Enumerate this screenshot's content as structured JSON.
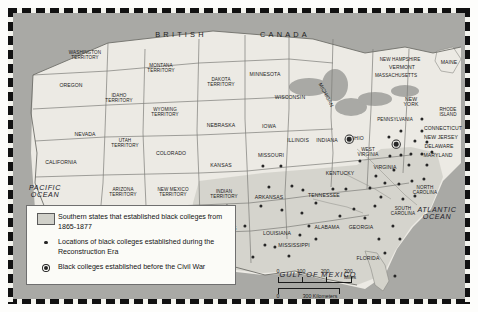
{
  "map": {
    "country_labels": [
      {
        "name": "british",
        "text": "BRITISH",
        "x": 168,
        "y": 22
      },
      {
        "name": "canada",
        "text": "CANADA",
        "x": 272,
        "y": 22
      }
    ],
    "ocean_labels": [
      {
        "name": "pacific-ocean",
        "text": "PACIFIC\nOCEAN",
        "x": 32,
        "y": 178
      },
      {
        "name": "atlantic-ocean",
        "text": "ATLANTIC\nOCEAN",
        "x": 424,
        "y": 200
      },
      {
        "name": "gulf-of-mexico",
        "text": "GULF OF MEXICO",
        "x": 305,
        "y": 262
      }
    ],
    "state_labels": [
      {
        "name": "washington-territory",
        "text": "WASHINGTON\nTERRITORY",
        "x": 72,
        "y": 43
      },
      {
        "name": "oregon",
        "text": "OREGON",
        "x": 58,
        "y": 73
      },
      {
        "name": "idaho-territory",
        "text": "IDAHO\nTERRITORY",
        "x": 106,
        "y": 86
      },
      {
        "name": "montana-territory",
        "text": "MONTANA\nTERRITORY",
        "x": 148,
        "y": 56
      },
      {
        "name": "wyoming-territory",
        "text": "WYOMING\nTERRITORY",
        "x": 152,
        "y": 100
      },
      {
        "name": "dakota-territory",
        "text": "DAKOTA\nTERRITORY",
        "x": 208,
        "y": 70
      },
      {
        "name": "minnesota",
        "text": "MINNESOTA",
        "x": 252,
        "y": 62
      },
      {
        "name": "wisconsin",
        "text": "WISCONSIN",
        "x": 277,
        "y": 85
      },
      {
        "name": "michigan",
        "text": "MICHIGAN",
        "x": 313,
        "y": 82,
        "rotate": 62
      },
      {
        "name": "nebraska",
        "text": "NEBRASKA",
        "x": 208,
        "y": 113
      },
      {
        "name": "iowa",
        "text": "IOWA",
        "x": 256,
        "y": 114
      },
      {
        "name": "illinois",
        "text": "ILLINOIS",
        "x": 285,
        "y": 128
      },
      {
        "name": "indiana",
        "text": "INDIANA",
        "x": 314,
        "y": 128
      },
      {
        "name": "ohio",
        "text": "OHIO",
        "x": 344,
        "y": 126
      },
      {
        "name": "nevada",
        "text": "NEVADA",
        "x": 72,
        "y": 122
      },
      {
        "name": "utah-territory",
        "text": "UTAH\nTERRITORY",
        "x": 112,
        "y": 131
      },
      {
        "name": "colorado",
        "text": "COLORADO",
        "x": 158,
        "y": 141
      },
      {
        "name": "california",
        "text": "CALIFORNIA",
        "x": 48,
        "y": 150
      },
      {
        "name": "kansas",
        "text": "KANSAS",
        "x": 208,
        "y": 153
      },
      {
        "name": "missouri",
        "text": "MISSOURI",
        "x": 258,
        "y": 143
      },
      {
        "name": "kentucky",
        "text": "KENTUCKY",
        "x": 327,
        "y": 161
      },
      {
        "name": "arizona-territory",
        "text": "ARIZONA\nTERRITORY",
        "x": 110,
        "y": 180
      },
      {
        "name": "new-mexico-territory",
        "text": "NEW MEXICO\nTERRITORY",
        "x": 160,
        "y": 180
      },
      {
        "name": "indian-territory",
        "text": "INDIAN\nTERRITORY",
        "x": 211,
        "y": 182
      },
      {
        "name": "arkansas",
        "text": "ARKANSAS",
        "x": 256,
        "y": 185
      },
      {
        "name": "tennessee",
        "text": "TENNESSEE",
        "x": 311,
        "y": 183
      },
      {
        "name": "texas",
        "text": "TEXAS",
        "x": 215,
        "y": 216
      },
      {
        "name": "louisiana",
        "text": "LOUISIANA",
        "x": 264,
        "y": 221
      },
      {
        "name": "mississippi",
        "text": "MISSISSIPPI",
        "x": 281,
        "y": 233
      },
      {
        "name": "alabama",
        "text": "ALABAMA",
        "x": 314,
        "y": 215
      },
      {
        "name": "georgia",
        "text": "GEORGIA",
        "x": 348,
        "y": 215
      },
      {
        "name": "florida",
        "text": "FLORIDA",
        "x": 355,
        "y": 246
      },
      {
        "name": "south-carolina",
        "text": "SOUTH\nCAROLINA",
        "x": 390,
        "y": 199
      },
      {
        "name": "north-carolina",
        "text": "NORTH\nCAROLINA",
        "x": 412,
        "y": 178
      },
      {
        "name": "virginia",
        "text": "VIRGINIA",
        "x": 372,
        "y": 155
      },
      {
        "name": "west-virginia",
        "text": "WEST\nVIRGINIA",
        "x": 355,
        "y": 140
      },
      {
        "name": "pennsylvania",
        "text": "PENNSYLVANIA",
        "x": 382,
        "y": 107
      },
      {
        "name": "new-york",
        "text": "NEW\nYORK",
        "x": 398,
        "y": 89
      },
      {
        "name": "new-hampshire",
        "text": "NEW HAMPSHIRE",
        "x": 387,
        "y": 47
      },
      {
        "name": "vermont",
        "text": "VERMONT",
        "x": 389,
        "y": 55
      },
      {
        "name": "massachusetts",
        "text": "MASSACHUSETTS",
        "x": 383,
        "y": 63
      },
      {
        "name": "maine",
        "text": "MAINE",
        "x": 436,
        "y": 50
      },
      {
        "name": "rhode-island",
        "text": "RHODE\nISLAND",
        "x": 435,
        "y": 100
      },
      {
        "name": "connecticut",
        "text": "CONNECTICUT",
        "x": 430,
        "y": 116
      },
      {
        "name": "new-jersey",
        "text": "NEW JERSEY",
        "x": 428,
        "y": 125
      },
      {
        "name": "delaware",
        "text": "DELAWARE",
        "x": 426,
        "y": 134
      },
      {
        "name": "maryland",
        "text": "MARYLAND",
        "x": 425,
        "y": 143
      }
    ],
    "reconstruction_colleges": [
      {
        "x": 250,
        "y": 153
      },
      {
        "x": 268,
        "y": 153
      },
      {
        "x": 256,
        "y": 174
      },
      {
        "x": 279,
        "y": 173
      },
      {
        "x": 248,
        "y": 193
      },
      {
        "x": 269,
        "y": 197
      },
      {
        "x": 290,
        "y": 177
      },
      {
        "x": 303,
        "y": 190
      },
      {
        "x": 320,
        "y": 176
      },
      {
        "x": 333,
        "y": 176
      },
      {
        "x": 289,
        "y": 200
      },
      {
        "x": 296,
        "y": 213
      },
      {
        "x": 303,
        "y": 226
      },
      {
        "x": 287,
        "y": 222
      },
      {
        "x": 276,
        "y": 243
      },
      {
        "x": 262,
        "y": 234
      },
      {
        "x": 252,
        "y": 232
      },
      {
        "x": 232,
        "y": 213
      },
      {
        "x": 221,
        "y": 231
      },
      {
        "x": 205,
        "y": 243
      },
      {
        "x": 240,
        "y": 244
      },
      {
        "x": 214,
        "y": 193
      },
      {
        "x": 198,
        "y": 205
      },
      {
        "x": 185,
        "y": 232
      },
      {
        "x": 327,
        "y": 203
      },
      {
        "x": 341,
        "y": 196
      },
      {
        "x": 352,
        "y": 205
      },
      {
        "x": 362,
        "y": 193
      },
      {
        "x": 366,
        "y": 226
      },
      {
        "x": 380,
        "y": 213
      },
      {
        "x": 387,
        "y": 226
      },
      {
        "x": 372,
        "y": 240
      },
      {
        "x": 382,
        "y": 263
      },
      {
        "x": 347,
        "y": 148
      },
      {
        "x": 363,
        "y": 163
      },
      {
        "x": 377,
        "y": 143
      },
      {
        "x": 388,
        "y": 142
      },
      {
        "x": 398,
        "y": 141
      },
      {
        "x": 409,
        "y": 141
      },
      {
        "x": 396,
        "y": 152
      },
      {
        "x": 414,
        "y": 152
      },
      {
        "x": 381,
        "y": 157
      },
      {
        "x": 372,
        "y": 170
      },
      {
        "x": 386,
        "y": 171
      },
      {
        "x": 399,
        "y": 168
      },
      {
        "x": 411,
        "y": 166
      },
      {
        "x": 357,
        "y": 175
      },
      {
        "x": 368,
        "y": 184
      },
      {
        "x": 390,
        "y": 186
      },
      {
        "x": 402,
        "y": 183
      },
      {
        "x": 376,
        "y": 124
      },
      {
        "x": 388,
        "y": 118
      },
      {
        "x": 402,
        "y": 128
      },
      {
        "x": 414,
        "y": 129
      },
      {
        "x": 409,
        "y": 118
      },
      {
        "x": 419,
        "y": 139
      },
      {
        "x": 409,
        "y": 106
      }
    ],
    "precivil_war_colleges": [
      {
        "x": 336,
        "y": 126
      },
      {
        "x": 383,
        "y": 131
      }
    ]
  },
  "legend": {
    "rows": [
      {
        "key": "swatch",
        "name": "legend-swatch-southern-states",
        "text": "Southern states that established\nblack colleges from 1865-1877"
      },
      {
        "key": "dot",
        "name": "legend-dot-reconstruction",
        "text": "Locations of black colleges established\nduring the Reconstruction Era"
      },
      {
        "key": "ring",
        "name": "legend-dot-precivil-war",
        "text": "Black colleges established before the\nCivil War"
      }
    ]
  },
  "scale": {
    "miles_ticks": [
      "0",
      "100",
      "200",
      "300 Miles"
    ],
    "km_ticks": [
      "0",
      "300 Kilometers"
    ]
  },
  "colors": {
    "land": "#eceae4",
    "shaded_south": "#d4d3cb",
    "water": "#a9a9a5",
    "border": "#6b6b6b",
    "marker": "#262626"
  }
}
